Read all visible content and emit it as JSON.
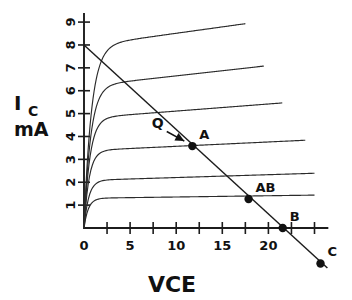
{
  "chart_data": {
    "type": "line",
    "title": "",
    "xlabel": "VCE",
    "ylabel_main": "I",
    "ylabel_sub": "C",
    "ylabel_units": "mA",
    "xlim": [
      0,
      26.5
    ],
    "ylim": [
      0,
      9.4
    ],
    "grid": false,
    "legend": "none",
    "x_tick_labels": [
      "0",
      "5",
      "10",
      "15",
      "20"
    ],
    "x_tick_values": [
      0,
      5,
      10,
      15,
      20
    ],
    "x_minor_tick_values": [
      2.5,
      7.5,
      12.5,
      17.5,
      22.5,
      25
    ],
    "y_tick_labels": [
      "1",
      "2",
      "3",
      "4",
      "5",
      "6",
      "7",
      "8",
      "9"
    ],
    "y_tick_values": [
      1,
      2,
      3,
      4,
      5,
      6,
      7,
      8,
      9
    ],
    "series": [
      {
        "name": "IB1",
        "plateau": 1.3,
        "knee_v": 1.1,
        "slope": 0.0055,
        "x_end": 25.0
      },
      {
        "name": "IB2",
        "plateau": 2.08,
        "knee_v": 1.2,
        "slope": 0.0125,
        "x_end": 25.0
      },
      {
        "name": "IB3",
        "plateau": 3.38,
        "knee_v": 1.3,
        "slope": 0.019,
        "x_end": 24.0
      },
      {
        "name": "IB4",
        "plateau": 4.8,
        "knee_v": 1.5,
        "slope": 0.031,
        "x_end": 21.5
      },
      {
        "name": "IB5",
        "plateau": 6.2,
        "knee_v": 1.7,
        "slope": 0.045,
        "x_end": 19.5
      },
      {
        "name": "IB6",
        "plateau": 7.95,
        "knee_v": 1.9,
        "slope": 0.056,
        "x_end": 17.5
      }
    ],
    "load_line": {
      "name": "DC load line",
      "x_start": 0.0,
      "y_start": 8.0,
      "x_end": 26.4,
      "y_end": -1.75
    },
    "annotations": [
      {
        "label": "Q",
        "kind": "arrow-text",
        "x": 8.0,
        "y": 4.35,
        "dot": false
      },
      {
        "label": "A",
        "kind": "point",
        "x": 11.75,
        "y": 3.58,
        "dot": true
      },
      {
        "label": "AB",
        "kind": "point",
        "x": 17.85,
        "y": 1.27,
        "dot": true
      },
      {
        "label": "B",
        "kind": "point",
        "x": 21.55,
        "y": 0.0,
        "dot": true
      },
      {
        "label": "C",
        "kind": "point",
        "x": 25.65,
        "y": -1.55,
        "dot": true
      }
    ]
  }
}
